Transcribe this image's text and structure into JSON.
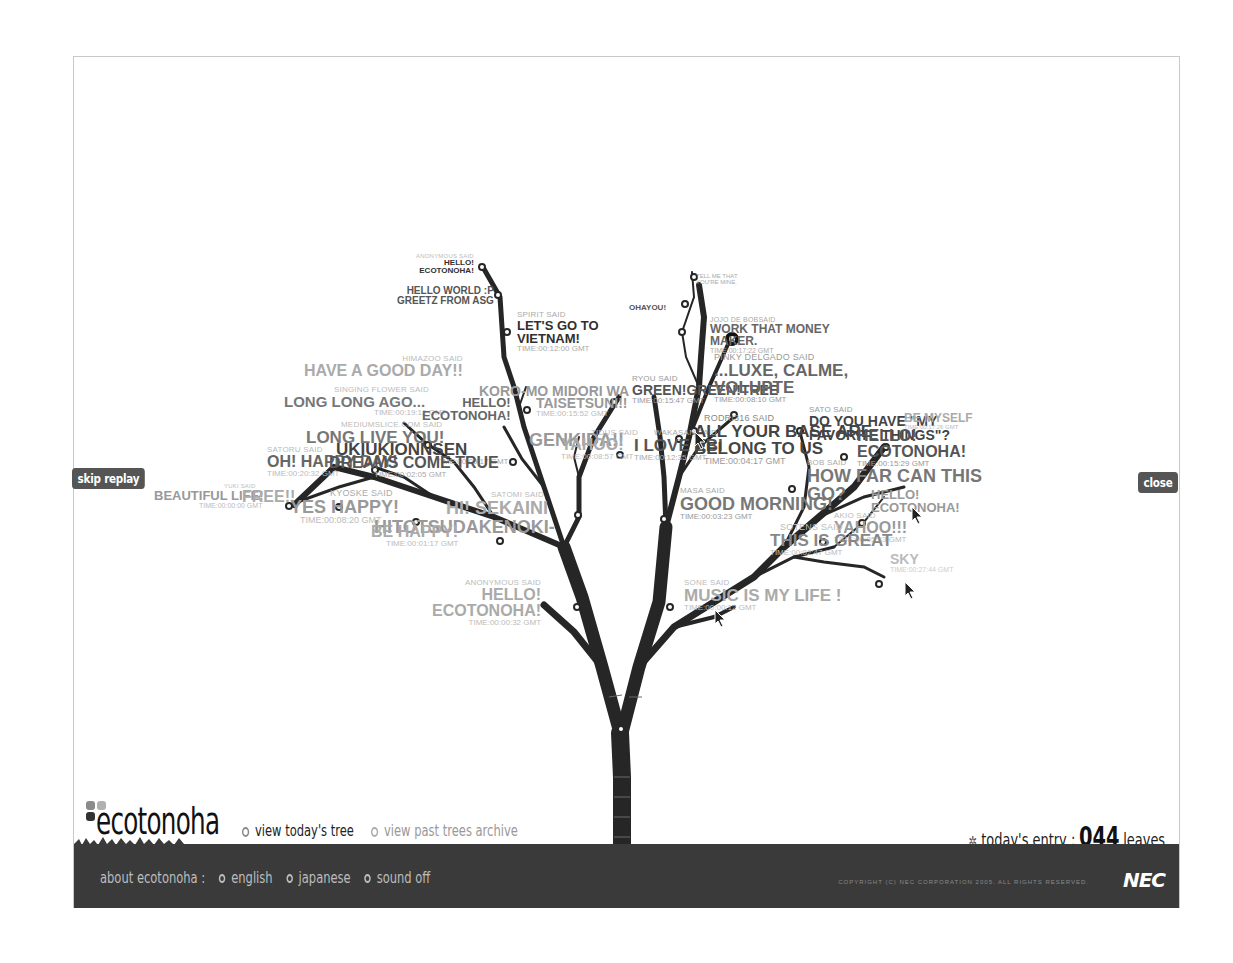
{
  "controls": {
    "skip_replay": "skip replay",
    "close": "close"
  },
  "brand": {
    "name": "ecotonoha",
    "logo_icon": "four-leaf-icon"
  },
  "nav": {
    "view_today": "view today's tree",
    "view_archive": "view past trees archive"
  },
  "entry": {
    "label": "today's entry :",
    "count": "044",
    "unit": "leaves",
    "icon": "leaf-cluster-icon"
  },
  "footer": {
    "about_label": "about ecotonoha :",
    "links": [
      "english",
      "japanese",
      "sound off"
    ],
    "copyright": "COPYRIGHT (C) NEC CORPORATION 2005. ALL RIGHTS RESERVED.",
    "sponsor": "NEC"
  },
  "colors": {
    "trunk": "#262626",
    "ground": "#3a3a3a",
    "button_bg": "#555555",
    "text_dark": "#2f2f2f",
    "text_mid": "#8c8c8c",
    "text_light": "#b5b5b5"
  },
  "leaves": [
    {
      "said": "ANONYMOUS SAID",
      "msg": "HELLO!\nECOTONOHA!",
      "time": ""
    },
    {
      "said": "",
      "msg": "HELLO WORLD :P\nGREETZ FROM ASG",
      "time": ""
    },
    {
      "said": "SPIRIT SAID",
      "msg": "LET'S GO TO\nVIETNAM!",
      "time": "TIME:00:12:00 GMT"
    },
    {
      "said": "",
      "msg": "TELL ME THAT\nYOU'RE MINE.",
      "time": ""
    },
    {
      "said": "",
      "msg": "OHAYOU!",
      "time": ""
    },
    {
      "said": "JOJO DE BOBSAID",
      "msg": "WORK THAT MONEY\nMAKER.",
      "time": "TIME:00:17:22 GMT"
    },
    {
      "said": "HIMAZOO SAID",
      "msg": "HAVE A GOOD DAY!!",
      "time": ""
    },
    {
      "said": "SINGING FLOWER SAID",
      "msg": "LONG LONG AGO...",
      "time": "TIME:00:19:12 GMT"
    },
    {
      "said": "",
      "msg": "HELLO!\nECOTONOHA!",
      "time": "TIME:00:14:46 GMT"
    },
    {
      "said": "",
      "msg": "KORO-MO MIDORI WA",
      "time": ""
    },
    {
      "said": "",
      "msg": "TAISETSUNI!!",
      "time": "TIME:00:15:52 GMT"
    },
    {
      "said": "RYOU SAID",
      "msg": "GREEN!GREEN!TREE",
      "time": "TIME:00:15:47 GMT"
    },
    {
      "said": "PINKY DELGADO SAID",
      "msg": "...LUXE, CALME,\nVOLUPTE",
      "time": "TIME:00:08:10 GMT"
    },
    {
      "said": "MEDIUMSLICE.COM SAID",
      "msg": "LONG LIVE YOU!",
      "time": ""
    },
    {
      "said": "",
      "msg": "GENKIDA!!",
      "time": ""
    },
    {
      "said": "",
      "msg": "UKIUKIONNSEN",
      "time": "TIME:00:09:17 GMT"
    },
    {
      "said": "TIDUS SAID",
      "msg": "YAHOO!",
      "time": "TIME:00:08:57 GMT"
    },
    {
      "said": "WAKASAN SAID",
      "msg": "I LOVE EBI",
      "time": "TIME:00:12:35 GMT"
    },
    {
      "said": "RODRI316 SAID",
      "msg": "ALL YOUR BASE ARE\nBELONG TO US",
      "time": "TIME:00:04:17 GMT"
    },
    {
      "said": "SATO SAID",
      "msg": "DO YOU HAVE \"MY\nFAVORITE THINGS\"?",
      "time": ""
    },
    {
      "said": "",
      "msg": "BE MYSELF",
      "time": "TIME:00:17:26 GMT"
    },
    {
      "said": "",
      "msg": "HELLO!\nECOTONOHA!",
      "time": "TIME:00:15:29 GMT"
    },
    {
      "said": "SATORU SAID",
      "msg": "OH! HAPPY DAY!",
      "time": "TIME:00:20:32 GMT"
    },
    {
      "said": "",
      "msg": "DREAMS COME TRUE",
      "time": "TIME:00:02:05 GMT"
    },
    {
      "said": "BOB SAID",
      "msg": "HOW FAR CAN THIS\nGO?",
      "time": ""
    },
    {
      "said": "",
      "msg": "HELLO!\nECOTONOHA!",
      "time": ""
    },
    {
      "said": "MASA SAID",
      "msg": "GOOD MORNING!",
      "time": "TIME:00:03:23 GMT"
    },
    {
      "said": "YUKI SAID",
      "msg": "BEAUTIFUL LIFE!",
      "time": "TIME:00:00:00 GMT"
    },
    {
      "said": "",
      "msg": "FREE!!",
      "time": ""
    },
    {
      "said": "KYOSKE SAID",
      "msg": "YES HAPPY!",
      "time": "TIME:00:08:20 GMT"
    },
    {
      "said": "SATOMI SAID",
      "msg": "HI! SEKAINI",
      "time": ""
    },
    {
      "said": "",
      "msg": "HITOTSUDAKENOKI-",
      "time": ""
    },
    {
      "said": "",
      "msg": "BE HAPPY!",
      "time": "TIME:00:01:17 GMT"
    },
    {
      "said": "AKIO SAID",
      "msg": "YAHOO!!!",
      "time": "TIME:00:05:33 GMT"
    },
    {
      "said": "SOTENS SAID",
      "msg": "THIS IS GREAT",
      "time": "TIME:00:02:47 GMT"
    },
    {
      "said": "",
      "msg": "SKY",
      "time": "TIME:00:27:44 GMT"
    },
    {
      "said": "ANONYMOUS SAID",
      "msg": "HELLO!\nECOTONOHA!",
      "time": "TIME:00:00:32 GMT"
    },
    {
      "said": "SONE SAID",
      "msg": "MUSIC IS MY LIFE !",
      "time": "TIME:00:00:12 GMT"
    }
  ]
}
